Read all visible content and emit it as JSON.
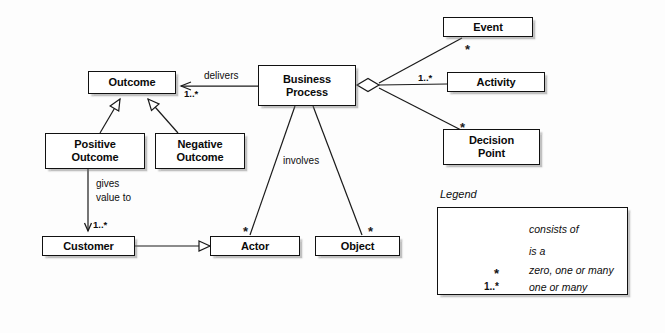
{
  "diagram": {
    "background": "#fdfdfd",
    "line_color": "#1a1a1a",
    "nodes": {
      "outcome": {
        "label": "Outcome"
      },
      "business_process": {
        "label_line1": "Business",
        "label_line2": "Process"
      },
      "positive_outcome": {
        "label_line1": "Positive",
        "label_line2": "Outcome"
      },
      "negative_outcome": {
        "label_line1": "Negative",
        "label_line2": "Outcome"
      },
      "customer": {
        "label": "Customer"
      },
      "actor": {
        "label": "Actor"
      },
      "object": {
        "label": "Object"
      },
      "event": {
        "label": "Event"
      },
      "activity": {
        "label": "Activity"
      },
      "decision_point": {
        "label_line1": "Decision",
        "label_line2": "Point"
      }
    },
    "edge_labels": {
      "delivers": "delivers",
      "involves": "involves",
      "gives_value_to_line1": "gives",
      "gives_value_to_line2": "value to"
    },
    "multiplicities": {
      "outcome_one_or_many": "1..*",
      "customer_one_or_many": "1..*",
      "activity_one_or_many": "1..*",
      "event_star": "*",
      "decision_point_star": "*",
      "actor_star": "*",
      "object_star": "*"
    },
    "legend": {
      "title": "Legend",
      "rows": [
        {
          "symbol": "diamond-line",
          "text": "consists of"
        },
        {
          "symbol": "hollow-triangle-line",
          "text": "is a"
        },
        {
          "symbol": "asterisk",
          "marker": "*",
          "text": "zero, one or many"
        },
        {
          "symbol": "one-or-many",
          "marker": "1..*",
          "text": "one or many"
        }
      ]
    }
  }
}
